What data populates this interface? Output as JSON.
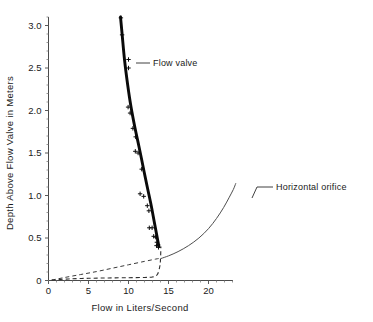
{
  "chart_data": {
    "type": "line",
    "title": "",
    "xlabel": "Flow in Liters/Second",
    "ylabel": "Depth Above Flow Valve in Meters",
    "xlim": [
      0,
      23
    ],
    "ylim": [
      0,
      3.2
    ],
    "xticks": [
      0,
      5,
      10,
      15,
      20
    ],
    "xticklabels": [
      "0",
      "5",
      "10",
      "15",
      "20"
    ],
    "yticks": [
      0,
      0.5,
      1.0,
      1.5,
      2.0,
      2.5,
      3.0
    ],
    "yticklabels": [
      "0",
      "0.5",
      "1.0",
      "1.5",
      "2.0",
      "2.5",
      "3.0"
    ],
    "grid": false,
    "legend": "inline-annotations",
    "annotations": [
      {
        "label": "Flow valve",
        "x": 12.2,
        "y": 2.55
      },
      {
        "label": "Horizontal orifice",
        "x": 24.5,
        "y": 1.12
      }
    ],
    "series": [
      {
        "name": "Flow valve",
        "style": "thick-solid",
        "points_x": [
          9.0,
          9.2,
          9.5,
          9.9,
          10.3,
          10.8,
          11.3,
          11.8,
          12.3,
          12.8,
          13.2,
          13.5,
          13.7,
          13.8
        ],
        "points_y": [
          3.1,
          2.9,
          2.6,
          2.3,
          2.05,
          1.8,
          1.58,
          1.35,
          1.12,
          0.9,
          0.7,
          0.55,
          0.45,
          0.4
        ]
      },
      {
        "name": "Flow valve data points",
        "style": "markers-plus",
        "points_x": [
          9.05,
          9.2,
          10.0,
          10.0,
          9.95,
          10.2,
          10.55,
          10.9,
          10.85,
          11.2,
          11.65,
          11.45,
          11.9,
          12.35,
          12.55,
          12.6,
          12.95,
          13.15,
          13.4,
          13.55,
          13.5,
          13.7,
          13.75
        ],
        "points_y": [
          3.09,
          2.89,
          2.6,
          2.5,
          2.04,
          1.97,
          1.79,
          1.69,
          1.52,
          1.5,
          1.31,
          1.02,
          0.99,
          0.88,
          0.82,
          0.62,
          0.62,
          0.52,
          0.51,
          0.45,
          0.41,
          0.42,
          0.39
        ]
      },
      {
        "name": "Horizontal orifice",
        "style": "thin-solid",
        "points_x": [
          14.1,
          15.0,
          16.2,
          17.5,
          18.8,
          20.0,
          21.0,
          21.9,
          22.6,
          23.1,
          23.4
        ],
        "points_y": [
          0.26,
          0.29,
          0.34,
          0.41,
          0.5,
          0.61,
          0.73,
          0.86,
          0.98,
          1.07,
          1.14
        ]
      },
      {
        "name": "Upper dashed curve",
        "style": "dashed",
        "points_x": [
          0.4,
          2.0,
          4.0,
          6.0,
          8.0,
          10.0,
          12.0,
          13.4,
          13.9,
          13.95
        ],
        "points_y": [
          0.005,
          0.035,
          0.07,
          0.105,
          0.145,
          0.185,
          0.225,
          0.252,
          0.26,
          0.26
        ]
      },
      {
        "name": "Lower dashed curve",
        "style": "dashed",
        "points_x": [
          0.4,
          2.5,
          5.0,
          7.5,
          10.0,
          12.0,
          13.0,
          13.6,
          13.9,
          14.0,
          14.05
        ],
        "points_y": [
          0.005,
          0.018,
          0.026,
          0.03,
          0.033,
          0.036,
          0.042,
          0.07,
          0.16,
          0.25,
          0.4
        ]
      }
    ]
  },
  "figure": {
    "background": "#ffffff",
    "axis_color": "#4a4a4a",
    "valve_color": "#0a0a0a",
    "orifice_color": "#4e4e4e",
    "dashed_color": "#3a3a3a"
  }
}
